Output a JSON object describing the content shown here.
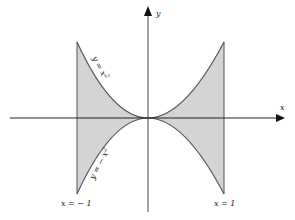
{
  "diagram": {
    "type": "region-between-curves",
    "axes": {
      "x_label": "x",
      "y_label": "y"
    },
    "curves": [
      {
        "id": "upper",
        "equation": "y = x²",
        "label": "y = x",
        "sup": "2"
      },
      {
        "id": "lower",
        "equation": "y = −x²",
        "label": "y = − x",
        "sup": "2"
      }
    ],
    "bounds": [
      {
        "id": "left",
        "label": "x = − 1"
      },
      {
        "id": "right",
        "label": "x = 1"
      }
    ],
    "colors": {
      "fill": "#d4d4d4",
      "curve": "#555555",
      "axis": "#222222"
    }
  }
}
